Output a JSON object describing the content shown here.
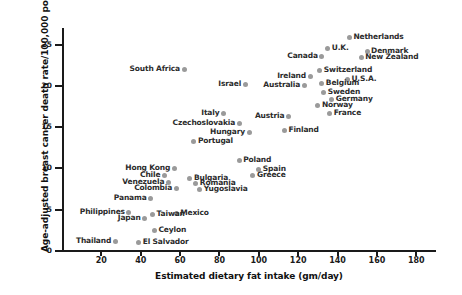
{
  "chart_data": {
    "type": "scatter",
    "title": "",
    "xlabel": "Estimated dietary fat intake (gm/day)",
    "ylabel": "Age-adjusted breast cancer death rate/100,000 pop.",
    "xlim": [
      0,
      190
    ],
    "ylim": [
      0,
      27
    ],
    "xticks": [
      20,
      40,
      60,
      80,
      100,
      120,
      140,
      160,
      180
    ],
    "yticks": [
      0,
      5,
      10,
      15,
      20,
      25
    ],
    "grid": false,
    "legend": null,
    "marker_color": "#9a9a9a",
    "axis_color": "#1a1a1a",
    "points": [
      {
        "label": "Netherlands",
        "x": 146,
        "y": 25.8,
        "side": "right"
      },
      {
        "label": "U.K.",
        "x": 135,
        "y": 24.5,
        "side": "right"
      },
      {
        "label": "Denmark",
        "x": 155,
        "y": 24.2,
        "side": "right"
      },
      {
        "label": "Canada",
        "x": 132,
        "y": 23.6,
        "side": "left"
      },
      {
        "label": "New Zealand",
        "x": 152,
        "y": 23.4,
        "side": "right"
      },
      {
        "label": "Switzerland",
        "x": 131,
        "y": 21.8,
        "side": "right"
      },
      {
        "label": "Ireland",
        "x": 126,
        "y": 21.1,
        "side": "left"
      },
      {
        "label": "U.S.A.",
        "x": 145,
        "y": 20.8,
        "side": "right"
      },
      {
        "label": "Belgium",
        "x": 132,
        "y": 20.3,
        "side": "right"
      },
      {
        "label": "Australia",
        "x": 123,
        "y": 20.0,
        "side": "left"
      },
      {
        "label": "Sweden",
        "x": 133,
        "y": 19.2,
        "side": "right"
      },
      {
        "label": "Germany",
        "x": 137,
        "y": 18.3,
        "side": "right"
      },
      {
        "label": "Norway",
        "x": 130,
        "y": 17.6,
        "side": "right"
      },
      {
        "label": "France",
        "x": 136,
        "y": 16.7,
        "side": "right"
      },
      {
        "label": "South Africa",
        "x": 62,
        "y": 22.0,
        "side": "left"
      },
      {
        "label": "Israel",
        "x": 93,
        "y": 20.2,
        "side": "left"
      },
      {
        "label": "Austin-placeholder-remove",
        "x": 0,
        "y": 0,
        "side": "right",
        "skip": true
      },
      {
        "label": "Austria",
        "x": 115,
        "y": 16.3,
        "side": "left"
      },
      {
        "label": "Finland",
        "x": 113,
        "y": 14.6,
        "side": "right"
      },
      {
        "label": "Italy",
        "x": 82,
        "y": 16.6,
        "side": "left"
      },
      {
        "label": "Czechoslovakia",
        "x": 90,
        "y": 15.4,
        "side": "left"
      },
      {
        "label": "Hungary",
        "x": 95,
        "y": 14.3,
        "side": "left"
      },
      {
        "label": "Portugal",
        "x": 67,
        "y": 13.2,
        "side": "right"
      },
      {
        "label": "Poland",
        "x": 90,
        "y": 10.9,
        "side": "right"
      },
      {
        "label": "Spain",
        "x": 100,
        "y": 9.9,
        "side": "right"
      },
      {
        "label": "Greece",
        "x": 97,
        "y": 9.2,
        "side": "right"
      },
      {
        "label": "Hong Kong",
        "x": 57,
        "y": 10.0,
        "side": "left"
      },
      {
        "label": "Chile",
        "x": 52,
        "y": 9.1,
        "side": "left"
      },
      {
        "label": "Bulgaria",
        "x": 65,
        "y": 8.8,
        "side": "right"
      },
      {
        "label": "Venezuela",
        "x": 54,
        "y": 8.3,
        "side": "left"
      },
      {
        "label": "Romania",
        "x": 68,
        "y": 8.2,
        "side": "right"
      },
      {
        "label": "Colombia",
        "x": 58,
        "y": 7.6,
        "side": "left"
      },
      {
        "label": "Yugoslavia",
        "x": 70,
        "y": 7.5,
        "side": "right"
      },
      {
        "label": "Panama",
        "x": 45,
        "y": 6.3,
        "side": "left"
      },
      {
        "label": "Philippines",
        "x": 34,
        "y": 4.7,
        "side": "left"
      },
      {
        "label": "Mexico",
        "x": 58,
        "y": 4.6,
        "side": "right"
      },
      {
        "label": "Taiwan",
        "x": 46,
        "y": 4.4,
        "side": "right"
      },
      {
        "label": "Japan",
        "x": 42,
        "y": 3.9,
        "side": "left"
      },
      {
        "label": "Ceylon",
        "x": 47,
        "y": 2.5,
        "side": "right"
      },
      {
        "label": "Thailand",
        "x": 27,
        "y": 1.1,
        "side": "left"
      },
      {
        "label": "El Salvador",
        "x": 39,
        "y": 1.0,
        "side": "right"
      }
    ]
  }
}
